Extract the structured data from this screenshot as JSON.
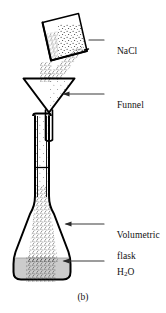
{
  "figure": {
    "caption": "(b)",
    "background_color": "#ffffff",
    "line_color": "#000000",
    "water_color": "#cccccc",
    "leader_color": "#3a3a3a",
    "stipple_color": "#1a1a1a"
  },
  "labels": [
    {
      "id": "nacl",
      "lines": [
        "NaCl"
      ],
      "target": "beaker-with-solid",
      "leader": "arrow-left"
    },
    {
      "id": "funnel",
      "lines": [
        "Funnel"
      ],
      "target": "funnel",
      "leader": "arrow-left"
    },
    {
      "id": "volumetric-flask",
      "lines": [
        "Volumetric",
        "flask"
      ],
      "target": "flask-body",
      "leader": "arrow-left"
    },
    {
      "id": "h2o",
      "lines": [
        "H",
        "2",
        "O"
      ],
      "text_plain": "H2O",
      "target": "water-in-flask",
      "leader": "arrow-left"
    }
  ],
  "label_text": {
    "nacl": "NaCl",
    "funnel": "Funnel",
    "volumetric_line1": "Volumetric",
    "volumetric_line2": "flask",
    "h2o_element": "H",
    "h2o_subscript": "2",
    "h2o_oxygen": "O"
  },
  "apparatus": {
    "beaker": {
      "name": "beaker-with-solid",
      "contents": "NaCl",
      "state": "tilted, pouring"
    },
    "funnel": {
      "name": "funnel",
      "state": "receiving solid"
    },
    "flask": {
      "name": "volumetric-flask",
      "contents": "H2O",
      "calibration_mark": true
    }
  }
}
